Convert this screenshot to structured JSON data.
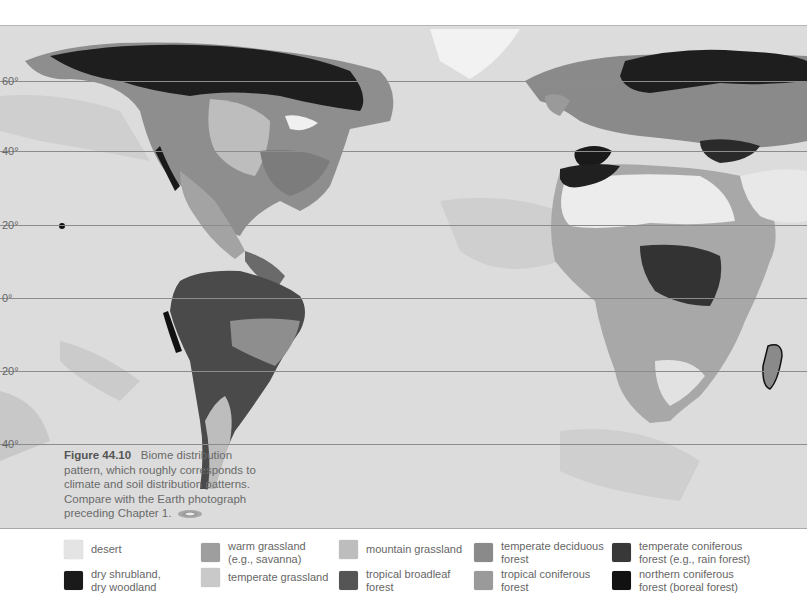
{
  "figure": {
    "number_label": "Figure 44.10",
    "caption": "Biome distribution pattern, which roughly corresponds to climate and soil distribution patterns. Compare with the Earth photograph preceding Chapter 1.",
    "cd_icon": "cd-rom-icon"
  },
  "map": {
    "latitude_lines": [
      {
        "label": "60°",
        "y": 81
      },
      {
        "label": "40°",
        "y": 151
      },
      {
        "label": "20°",
        "y": 225
      },
      {
        "label": "0°",
        "y": 298
      },
      {
        "label": "20°",
        "y": 371
      },
      {
        "label": "40°",
        "y": 444
      }
    ],
    "ocean_color": "#dcdcdc"
  },
  "legend": {
    "items": [
      {
        "label": "desert",
        "color": "#e4e4e4"
      },
      {
        "label": "dry shrubland,\ndry woodland",
        "color": "#1a1a1a"
      },
      {
        "label": "warm grassland\n(e.g., savanna)",
        "color": "#9e9e9e"
      },
      {
        "label": "temperate grassland",
        "color": "#c9c9c9"
      },
      {
        "label": "mountain grassland",
        "color": "#bdbdbd"
      },
      {
        "label": "tropical broadleaf\nforest",
        "color": "#555555"
      },
      {
        "label": "temperate deciduous\nforest",
        "color": "#8a8a8a"
      },
      {
        "label": "tropical coniferous\nforest",
        "color": "#9a9a9a"
      },
      {
        "label": "temperate coniferous\nforest (e.g., rain forest)",
        "color": "#383838"
      },
      {
        "label": "northern coniferous\nforest (boreal forest)",
        "color": "#111111"
      }
    ]
  }
}
